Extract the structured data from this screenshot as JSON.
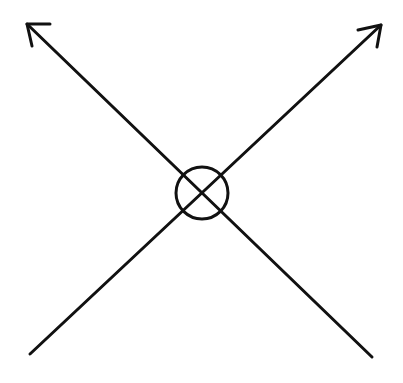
{
  "diagram": {
    "background": "#ffffff",
    "stroke_color": "#111111",
    "stroke_width": 3,
    "lines": [
      {
        "name": "diagonal-line-nw-se",
        "x1": 27,
        "y1": 24,
        "x2": 372,
        "y2": 357,
        "arrow_at": "start"
      },
      {
        "name": "diagonal-line-ne-sw",
        "x1": 381,
        "y1": 25,
        "x2": 30,
        "y2": 354,
        "arrow_at": "start"
      }
    ],
    "arrowheads": [
      {
        "name": "arrowhead-nw",
        "points": "50,24 27,24 32,46"
      },
      {
        "name": "arrowhead-ne",
        "points": "358,30 381,25 377,47"
      }
    ],
    "circle": {
      "name": "crossing-circle",
      "cx": 202,
      "cy": 193,
      "r": 26
    }
  }
}
